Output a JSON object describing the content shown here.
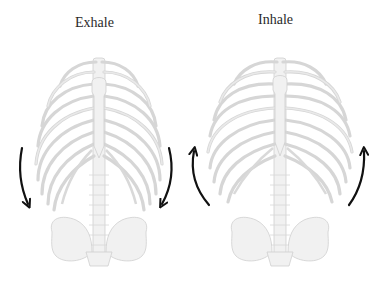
{
  "diagram": {
    "panels": [
      {
        "id": "exhale",
        "label": "Exhale",
        "arrow_direction": "down",
        "arrow_color": "#111111",
        "description": "Rib cage narrows; ribs move downward"
      },
      {
        "id": "inhale",
        "label": "Inhale",
        "arrow_direction": "up",
        "arrow_color": "#111111",
        "description": "Rib cage expands; ribs move upward and outward"
      }
    ],
    "colors": {
      "bone_fill": "#f1f1f1",
      "bone_stroke": "#cfcfcf",
      "background": "#ffffff",
      "text": "#2a2a2a"
    }
  }
}
